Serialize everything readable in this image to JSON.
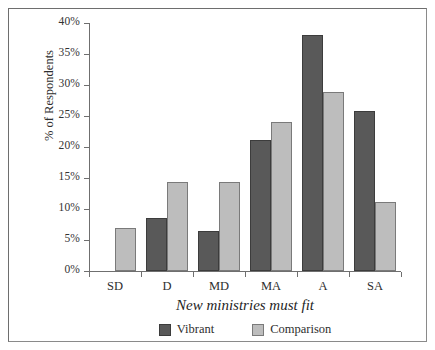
{
  "chart_data": {
    "type": "bar",
    "title": "",
    "xlabel": "New ministries must fit",
    "ylabel": "% of Respondents",
    "categories": [
      "SD",
      "D",
      "MD",
      "MA",
      "A",
      "SA"
    ],
    "series": [
      {
        "name": "Vibrant",
        "color": "#595959",
        "values": [
          0,
          8.5,
          6.4,
          21.2,
          38.0,
          25.8
        ]
      },
      {
        "name": "Comparison",
        "color": "#bdbdbd",
        "values": [
          7.0,
          14.4,
          14.3,
          24.1,
          28.9,
          11.2
        ]
      }
    ],
    "ylim": [
      0,
      40
    ],
    "ytick_values": [
      0,
      5,
      10,
      15,
      20,
      25,
      30,
      35,
      40
    ],
    "ytick_labels": [
      "0%",
      "5%",
      "10%",
      "15%",
      "20%",
      "25%",
      "30%",
      "35%",
      "40%"
    ],
    "grid": false,
    "legend_position": "bottom"
  },
  "legend": {
    "items": [
      {
        "label": "Vibrant"
      },
      {
        "label": "Comparison"
      }
    ]
  }
}
